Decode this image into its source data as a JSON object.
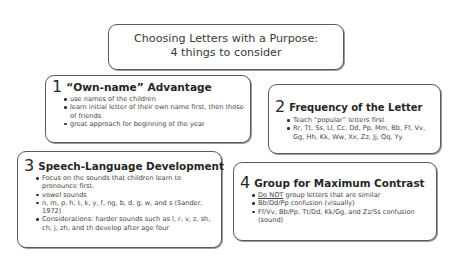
{
  "title": {
    "line1": "Choosing Letters with a Purpose:",
    "line2": "4 things to consider"
  },
  "boxes": [
    {
      "number": "1",
      "heading": "“Own-name” Advantage",
      "bullets": [
        "use names of the children",
        "learn initial letter of their own name first, then those of friends",
        "great approach for beginning of the year"
      ]
    },
    {
      "number": "2",
      "heading": "Frequency of the Letter",
      "bullets": [
        "Teach “popular” letters first",
        "Rr, Tt, Ss, Ll, Cc, Dd, Pp, Mm, Bb, Ff, Vv, Gg, Hh, Kk, Ww, Xx, Zz, Jj, Qq, Yy."
      ]
    },
    {
      "number": "3",
      "heading": "Speech-Language Development",
      "bullets": [
        "Focus on the sounds that children learn to pronounce first.",
        "vowel sounds",
        "n, m, p, h, t, k, y, f, ng, b, d, g, w, and s (Sander, 1972)",
        "Considerations: harder sounds such as l, r, v, z, sh, ch, j, zh, and th develop after age four"
      ]
    },
    {
      "number": "4",
      "heading": "Group for Maximum Contrast",
      "bullets_first_underlined": "Do NOT",
      "bullets_first_rest": " group letters that are similar",
      "bullets": [
        "Bb/Dd/Pp confusion (visually)",
        "Ff/Vv, Bb/Pp, Tt/Dd, Kk/Gg, and Zz/Ss confusion (sound)"
      ]
    }
  ],
  "colors": {
    "border": "#5a5a5a",
    "text": "#3a3a3a",
    "heading": "#262626",
    "background": "#ffffff"
  }
}
